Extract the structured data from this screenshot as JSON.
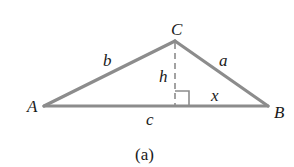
{
  "diagram": {
    "type": "triangle",
    "caption": "(a)",
    "colors": {
      "side": "#8c8c8c",
      "altitude": "#8c8c8c",
      "text": "#1a1a1a"
    },
    "vertices": {
      "A": {
        "label": "A",
        "x": 44,
        "y": 106
      },
      "B": {
        "label": "B",
        "x": 268,
        "y": 106
      },
      "C": {
        "label": "C",
        "x": 175,
        "y": 41
      }
    },
    "sides": {
      "a": {
        "label": "a",
        "from": "C",
        "to": "B"
      },
      "b": {
        "label": "b",
        "from": "A",
        "to": "C"
      },
      "c": {
        "label": "c",
        "from": "A",
        "to": "B"
      }
    },
    "altitude": {
      "label": "h",
      "from": "C",
      "foot": {
        "x": 175,
        "y": 106
      },
      "style": "dashed"
    },
    "segment": {
      "label": "x",
      "from": "foot",
      "to": "B"
    },
    "right_angle_marker": {
      "at": "foot",
      "size": 14
    }
  }
}
